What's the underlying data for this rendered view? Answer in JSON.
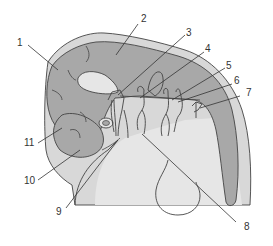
{
  "diagram": {
    "type": "anatomical-illustration",
    "colors": {
      "background": "#ffffff",
      "outer_layer": "#d8d8d8",
      "dark_tissue": "#a8a8a8",
      "light_tissue": "#e4e4e4",
      "outline": "#444444",
      "leader_line": "#333333"
    },
    "labels": [
      {
        "id": "1",
        "text": "1"
      },
      {
        "id": "2",
        "text": "2"
      },
      {
        "id": "3",
        "text": "3"
      },
      {
        "id": "4",
        "text": "4"
      },
      {
        "id": "5",
        "text": "5"
      },
      {
        "id": "6",
        "text": "6"
      },
      {
        "id": "7",
        "text": "7"
      },
      {
        "id": "8",
        "text": "8"
      },
      {
        "id": "9",
        "text": "9"
      },
      {
        "id": "10",
        "text": "10"
      },
      {
        "id": "11",
        "text": "11"
      }
    ]
  }
}
